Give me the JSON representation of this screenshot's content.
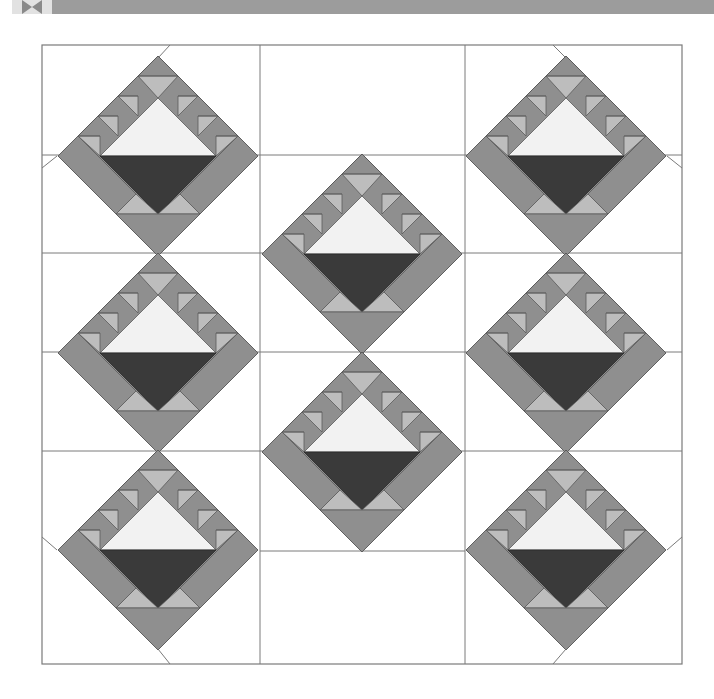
{
  "header": {
    "icon": "bowtie-quilt-icon",
    "band_color": "#9c9c9c",
    "tile_color": "#e2e2e2"
  },
  "diagram": {
    "frame": {
      "x": 42,
      "y": 45,
      "width": 640,
      "height": 619
    },
    "columns": [
      {
        "x0": 42,
        "x1": 260
      },
      {
        "x0": 260,
        "x1": 465
      },
      {
        "x0": 465,
        "x1": 682
      }
    ],
    "horizontal_lines": [
      {
        "x0": 42,
        "x1": 260,
        "y": 155
      },
      {
        "x0": 42,
        "x1": 260,
        "y": 253
      },
      {
        "x0": 42,
        "x1": 260,
        "y": 352
      },
      {
        "x0": 42,
        "x1": 260,
        "y": 451
      },
      {
        "x0": 260,
        "x1": 465,
        "y": 155
      },
      {
        "x0": 260,
        "x1": 465,
        "y": 253
      },
      {
        "x0": 260,
        "x1": 465,
        "y": 352
      },
      {
        "x0": 260,
        "x1": 465,
        "y": 451
      },
      {
        "x0": 260,
        "x1": 465,
        "y": 551
      },
      {
        "x0": 465,
        "x1": 682,
        "y": 155
      },
      {
        "x0": 465,
        "x1": 682,
        "y": 253
      },
      {
        "x0": 465,
        "x1": 682,
        "y": 352
      },
      {
        "x0": 465,
        "x1": 682,
        "y": 451
      }
    ],
    "setting_diagonals": [
      {
        "x1": 158,
        "y1": 58,
        "x2": 170,
        "y2": 45
      },
      {
        "x1": 57,
        "y1": 156,
        "x2": 42,
        "y2": 168
      },
      {
        "x1": 566,
        "y1": 58,
        "x2": 553,
        "y2": 45
      },
      {
        "x1": 667,
        "y1": 156,
        "x2": 682,
        "y2": 168
      },
      {
        "x1": 57,
        "y1": 550,
        "x2": 42,
        "y2": 537
      },
      {
        "x1": 158,
        "y1": 649,
        "x2": 170,
        "y2": 664
      },
      {
        "x1": 667,
        "y1": 550,
        "x2": 682,
        "y2": 537
      },
      {
        "x1": 566,
        "y1": 649,
        "x2": 553,
        "y2": 664
      }
    ],
    "blocks": [
      {
        "name": "block-left-top",
        "cx": 158,
        "cy": 156
      },
      {
        "name": "block-left-middle",
        "cx": 158,
        "cy": 353
      },
      {
        "name": "block-left-bottom",
        "cx": 158,
        "cy": 550
      },
      {
        "name": "block-center-upper",
        "cx": 362,
        "cy": 254
      },
      {
        "name": "block-center-lower",
        "cx": 362,
        "cy": 452
      },
      {
        "name": "block-right-top",
        "cx": 566,
        "cy": 156
      },
      {
        "name": "block-right-middle",
        "cx": 566,
        "cy": 353
      },
      {
        "name": "block-right-bottom",
        "cx": 566,
        "cy": 550
      }
    ],
    "block_half_diagonal": 100,
    "colors": {
      "line": "#7a7a7a",
      "background": "#ffffff",
      "medium_gray": "#8f8f8f",
      "light_gray": "#bdbdbd",
      "basket_light": "#f2f2f2",
      "basket_dark": "#3a3a3a",
      "outline": "#5a5a5a"
    }
  }
}
